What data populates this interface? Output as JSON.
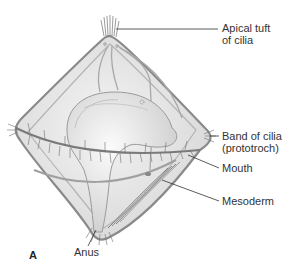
{
  "figure": {
    "panel_letter": "A",
    "labels": [
      {
        "id": "apical",
        "line1": "Apical tuft",
        "line2": "of cilia"
      },
      {
        "id": "band",
        "line1": "Band of cilia",
        "line2": "(prototroch)"
      },
      {
        "id": "mouth",
        "line1": "Mouth"
      },
      {
        "id": "mesoderm",
        "line1": "Mesoderm"
      },
      {
        "id": "anus",
        "line1": "Anus"
      }
    ],
    "colors": {
      "outline": "#8a8a8a",
      "fill": "#e8e8e8",
      "gut": "#dcdcdc",
      "cilia": "#6e6e6e",
      "leader": "#333333",
      "text": "#333333"
    }
  }
}
